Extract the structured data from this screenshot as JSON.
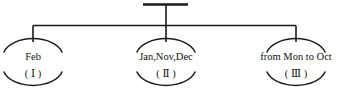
{
  "diagram": {
    "type": "tree-diagram",
    "line_color": "#1a1a1a",
    "text_color": "#111111",
    "background": "#ffffff",
    "root": {
      "name": "root-stem",
      "bar": {
        "x1": 143,
        "x2": 188,
        "y": 4
      },
      "stem": {
        "x": 166,
        "y1": 4,
        "y2": 25
      },
      "crossbar": {
        "x1": 33,
        "x2": 296,
        "y": 25
      }
    },
    "nodes": [
      {
        "id": "node-1",
        "label": "Feb",
        "numeral": "( Ⅰ )",
        "cx": 33,
        "drop": {
          "y1": 25,
          "y2": 41
        },
        "top_arc": {
          "rx": 32,
          "ry": 20,
          "cy": 60
        },
        "bottom_arc": {
          "rx": 32,
          "ry": 20,
          "cy": 60
        },
        "label_y": 58,
        "numeral_y": 74
      },
      {
        "id": "node-2",
        "label": "Jan,Nov,Dec",
        "numeral": "( Ⅱ )",
        "cx": 166,
        "drop": {
          "y1": 25,
          "y2": 41
        },
        "top_arc": {
          "rx": 32,
          "ry": 20,
          "cy": 60
        },
        "bottom_arc": {
          "rx": 32,
          "ry": 20,
          "cy": 60
        },
        "label_y": 58,
        "numeral_y": 74
      },
      {
        "id": "node-3",
        "label": "from Mon to Oct",
        "numeral": "( Ⅲ )",
        "cx": 296,
        "drop": {
          "y1": 25,
          "y2": 41
        },
        "top_arc": {
          "rx": 32,
          "ry": 20,
          "cy": 60
        },
        "bottom_arc": {
          "rx": 32,
          "ry": 20,
          "cy": 60
        },
        "label_y": 58,
        "numeral_y": 74
      }
    ]
  }
}
